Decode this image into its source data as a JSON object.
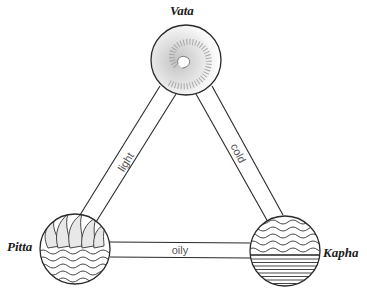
{
  "diagram": {
    "title": "",
    "nodes": [
      {
        "id": "vata",
        "label": "Vata",
        "symbol": "spiral-wind-icon"
      },
      {
        "id": "pitta",
        "label": "Pitta",
        "symbol": "flames-over-water-icon"
      },
      {
        "id": "kapha",
        "label": "Kapha",
        "symbol": "water-over-earth-icon"
      }
    ],
    "edges": [
      {
        "from": "vata",
        "to": "pitta",
        "label": "light"
      },
      {
        "from": "vata",
        "to": "kapha",
        "label": "cold"
      },
      {
        "from": "pitta",
        "to": "kapha",
        "label": "oily"
      }
    ],
    "colors": {
      "stroke": "#2a2a2a",
      "background": "#ffffff"
    }
  }
}
